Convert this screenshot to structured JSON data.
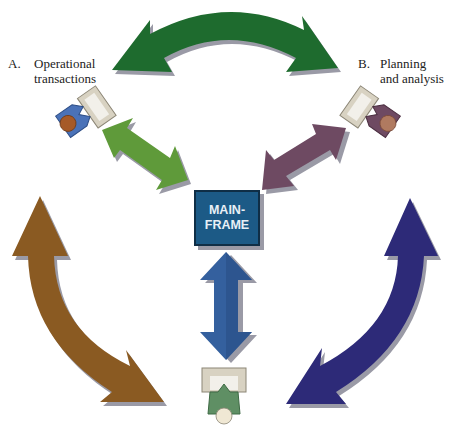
{
  "labels": {
    "a_letter": "A.",
    "a_line1": "Operational",
    "a_line2": "transactions",
    "b_letter": "B.",
    "b_line1": "Planning",
    "b_line2": "and analysis"
  },
  "center": {
    "line1": "MAIN-",
    "line2": "FRAME"
  },
  "nodes": [
    {
      "id": "A",
      "role": "Operational transactions",
      "person_color": "#4a72b8",
      "position": "top-left"
    },
    {
      "id": "B",
      "role": "Planning and analysis",
      "person_color": "#6e4a62",
      "position": "top-right"
    },
    {
      "id": "C",
      "role": "user",
      "person_color": "#5f8f64",
      "position": "bottom-center"
    }
  ],
  "arrows": [
    {
      "name": "A-B",
      "color": "#1e6b2e",
      "type": "curved-double"
    },
    {
      "name": "A-mainframe",
      "color": "#5f9a3a",
      "type": "straight-double"
    },
    {
      "name": "B-mainframe",
      "color": "#6e4a62",
      "type": "straight-double"
    },
    {
      "name": "A-C",
      "color": "#8a5a22",
      "type": "curved-double"
    },
    {
      "name": "B-C",
      "color": "#2d2a78",
      "type": "curved-double"
    },
    {
      "name": "mainframe-C",
      "color": "#34609e",
      "type": "straight-double"
    }
  ],
  "colors": {
    "shadow": "#9a9aa6",
    "desk": "#d8d2c2",
    "desk_inner": "#f2f0ea",
    "mainframe_bg": "#1c5a86"
  }
}
